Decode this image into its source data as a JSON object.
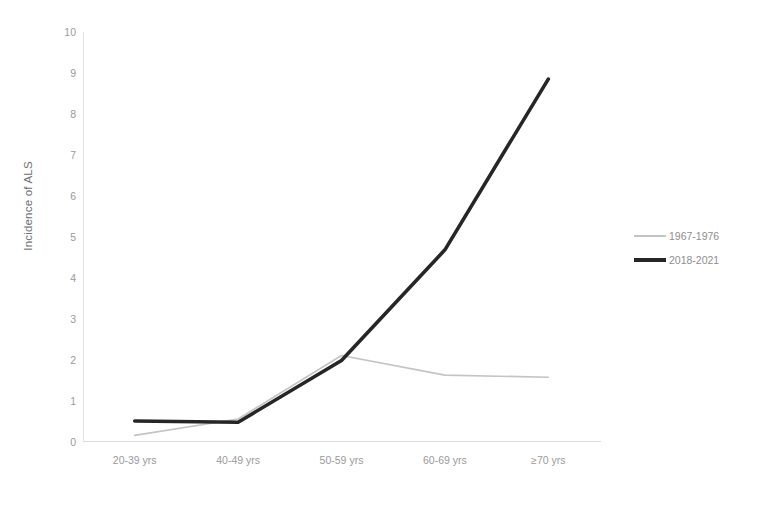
{
  "chart_data": {
    "type": "line",
    "title": "",
    "xlabel": "",
    "ylabel": "Incidence of ALS",
    "ylim": [
      0,
      10
    ],
    "ytick_step": 1,
    "yticks": [
      "10",
      "9",
      "8",
      "7",
      "6",
      "5",
      "4",
      "3",
      "2",
      "1",
      "0"
    ],
    "grid": false,
    "legend_position": "right",
    "categories": [
      "20-39 yrs",
      "40-49 yrs",
      "50-59 yrs",
      "60-69 yrs",
      "≥70 yrs"
    ],
    "series": [
      {
        "name": "1967-1976",
        "values": [
          0.15,
          0.55,
          2.1,
          1.62,
          1.57
        ],
        "color": "#c4c4c4",
        "line_width": 1.6
      },
      {
        "name": "2018-2021",
        "values": [
          0.5,
          0.47,
          1.98,
          4.68,
          8.85
        ],
        "color": "#262626",
        "line_width": 3.6
      }
    ]
  },
  "axis": {
    "y_title": "Incidence of ALS"
  },
  "legend": {
    "entries": [
      {
        "label": "1967-1976",
        "marker": "thin-line-swatch"
      },
      {
        "label": "2018-2021",
        "marker": "thick-line-swatch"
      }
    ]
  }
}
